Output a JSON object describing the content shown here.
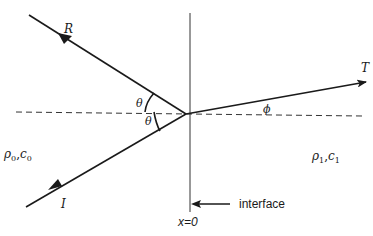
{
  "diagram": {
    "type": "reflection-refraction-at-interface",
    "rays": {
      "incident": {
        "label": "I"
      },
      "reflected": {
        "label": "R"
      },
      "transmitted": {
        "label": "T"
      }
    },
    "angles": {
      "incident_angle": "θ",
      "reflected_angle": "θ",
      "transmitted_angle": "ϕ"
    },
    "media": {
      "left": {
        "rho": "ρ",
        "rho_sub": "0",
        "sep": ",",
        "c": "c",
        "c_sub": "0"
      },
      "right": {
        "rho": "ρ",
        "rho_sub": "1",
        "sep": ",",
        "c": "c",
        "c_sub": "1"
      }
    },
    "interface": {
      "position_label": "x=0",
      "annotation": "interface"
    }
  }
}
